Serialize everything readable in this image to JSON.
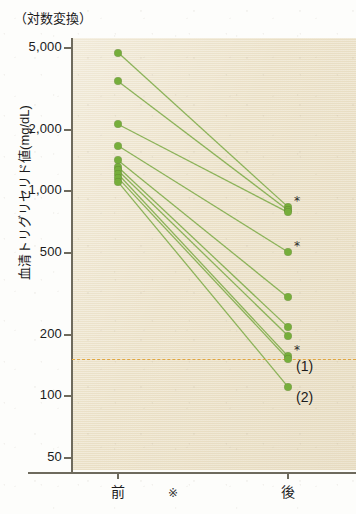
{
  "figure": {
    "top_caption": "（対数変換）",
    "bottom_mark": "※",
    "accent_color": "#76ae3b",
    "panel_color": "#ece2c8",
    "reference_line_color": "#e0a33a"
  },
  "axes": {
    "y_title": "血清トリグリセリド値(mg/dL)",
    "y_ticks": [
      "5,000",
      "2,000",
      "1,000",
      "500",
      "200",
      "100",
      "50"
    ],
    "y_tick_values": [
      5000,
      2000,
      1000,
      500,
      200,
      100,
      50
    ],
    "x_ticks": [
      "前",
      "後"
    ],
    "scale": "log"
  },
  "annotations": {
    "point_labels": [
      "(1)",
      "(2)"
    ],
    "significance_marker": "*"
  },
  "chart_data": {
    "type": "line",
    "title": "",
    "subtitle": "（対数変換）",
    "xlabel": "",
    "ylabel": "血清トリグリセリド値(mg/dL)",
    "x": [
      "前",
      "後"
    ],
    "categories": [
      "前",
      "後"
    ],
    "yscale": "log",
    "ylim": [
      40,
      6000
    ],
    "ytick_values": [
      5000,
      2000,
      1000,
      500,
      200,
      100,
      50
    ],
    "ytick_labels": [
      "5,000",
      "2,000",
      "1,000",
      "500",
      "200",
      "100",
      "50"
    ],
    "grid": false,
    "legend": "none",
    "reference_line": {
      "value": 150,
      "style": "dashed",
      "color": "#e0a33a",
      "label": ""
    },
    "series": [
      {
        "name": "症例1",
        "values": [
          4700,
          830
        ],
        "marker": "*",
        "annotation": ""
      },
      {
        "name": "症例2",
        "values": [
          3400,
          800
        ],
        "marker": "",
        "annotation": ""
      },
      {
        "name": "症例3",
        "values": [
          2100,
          780
        ],
        "marker": "",
        "annotation": ""
      },
      {
        "name": "症例4",
        "values": [
          1650,
          500
        ],
        "marker": "*",
        "annotation": ""
      },
      {
        "name": "症例5",
        "values": [
          1400,
          300
        ],
        "marker": "",
        "annotation": ""
      },
      {
        "name": "症例6",
        "values": [
          1300,
          215
        ],
        "marker": "",
        "annotation": ""
      },
      {
        "name": "症例7",
        "values": [
          1250,
          195
        ],
        "marker": "",
        "annotation": ""
      },
      {
        "name": "症例8",
        "values": [
          1200,
          155
        ],
        "marker": "*",
        "annotation": "(1)"
      },
      {
        "name": "症例9",
        "values": [
          1150,
          150
        ],
        "marker": "",
        "annotation": ""
      },
      {
        "name": "症例10",
        "values": [
          1100,
          110
        ],
        "marker": "",
        "annotation": "(2)"
      }
    ]
  }
}
